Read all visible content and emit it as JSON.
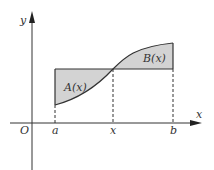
{
  "diagram": {
    "axes": {
      "x_label": "x",
      "y_label": "y",
      "origin_label": "O"
    },
    "ticks": [
      {
        "label": "a",
        "x": 55
      },
      {
        "label": "x",
        "x": 113
      },
      {
        "label": "b",
        "x": 173
      }
    ],
    "regions": [
      {
        "label": "A(x)",
        "description": "area between horizontal line and curve from a to x, below line"
      },
      {
        "label": "B(x)",
        "description": "area between curve and horizontal line from x to b, above line"
      }
    ],
    "colors": {
      "fill": "#d3d3d3",
      "stroke": "#333333",
      "background": "#ffffff"
    }
  }
}
